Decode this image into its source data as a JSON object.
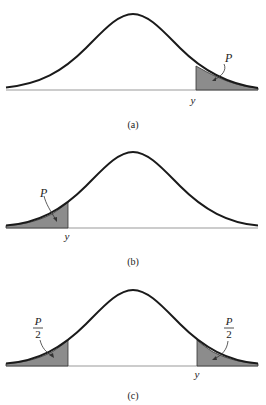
{
  "figure": {
    "panels": [
      {
        "id": "a",
        "caption": "(a)",
        "tail": "right",
        "area_label": "P",
        "cut_label": "y"
      },
      {
        "id": "b",
        "caption": "(b)",
        "tail": "left",
        "area_label": "P",
        "cut_label": "y"
      },
      {
        "id": "c",
        "caption": "(c)",
        "tail": "both",
        "area_label_numerator": "P",
        "area_label_denominator": "2",
        "cut_label": "y"
      }
    ]
  },
  "colors": {
    "curve": "#1a1a1a",
    "shade": "#8c8c8c",
    "axis": "#999999"
  }
}
